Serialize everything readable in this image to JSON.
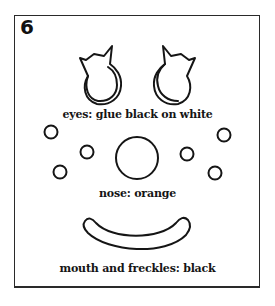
{
  "page": {
    "step_number": "6",
    "labels": {
      "eyes": "eyes: glue black on white",
      "nose": "nose: orange",
      "mouth": "mouth and freckles: black"
    },
    "colors": {
      "line": "#151515",
      "background": "#ffffff"
    },
    "shapes": {
      "eyes": 2,
      "nose": 1,
      "freckles": 6,
      "mouth": 1
    }
  }
}
